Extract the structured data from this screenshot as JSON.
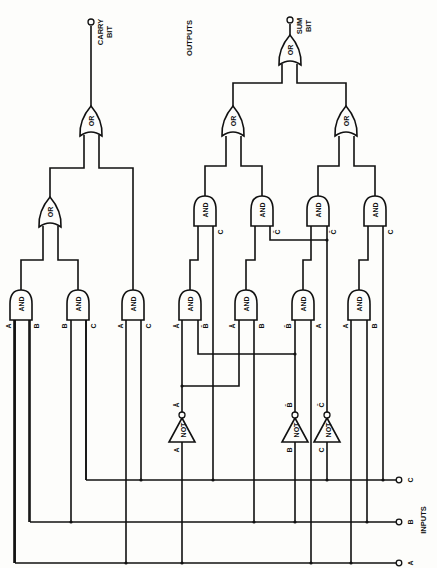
{
  "diagram": {
    "type": "full-adder logic circuit",
    "orientation": "rotated 90deg (inputs at bottom, outputs at top)",
    "labels": {
      "outputs": "OUTPUTS",
      "inputs": "INPUTS",
      "carry_line1": "CARRY",
      "carry_line2": "BIT",
      "sum_line1": "SUM",
      "sum_line2": "BIT"
    },
    "inputs": [
      {
        "id": "A",
        "label": "A"
      },
      {
        "id": "B",
        "label": "B"
      },
      {
        "id": "C",
        "label": "C"
      }
    ],
    "gate_names": {
      "and": "AND",
      "or": "OR",
      "not": "NOT"
    },
    "not_gates": [
      {
        "id": "not-a",
        "in": "A",
        "out": "Ā"
      },
      {
        "id": "not-b",
        "in": "B",
        "out": "B̄"
      },
      {
        "id": "not-c",
        "in": "C",
        "out": "C̄"
      }
    ],
    "carry_section": {
      "and_gates": [
        {
          "id": "and-ab",
          "inputs": [
            "A",
            "B"
          ]
        },
        {
          "id": "and-bc",
          "inputs": [
            "B",
            "C"
          ]
        },
        {
          "id": "and-ac",
          "inputs": [
            "A",
            "C"
          ]
        }
      ],
      "or_gates": [
        {
          "id": "or-carry-1",
          "inputs": [
            "and-ab",
            "and-bc"
          ]
        },
        {
          "id": "or-carry-2",
          "inputs": [
            "or-carry-1",
            "and-ac"
          ]
        }
      ],
      "output": "CARRY BIT"
    },
    "sum_section": {
      "lower_and_gates": [
        {
          "id": "and-nanb",
          "inputs": [
            "Ā",
            "B̄"
          ]
        },
        {
          "id": "and-nab",
          "inputs": [
            "Ā",
            "B"
          ]
        },
        {
          "id": "and-nba",
          "inputs": [
            "B̄",
            "A"
          ]
        },
        {
          "id": "and-ab2",
          "inputs": [
            "A",
            "B"
          ]
        }
      ],
      "upper_and_gates": [
        {
          "id": "and-u1",
          "inputs": [
            "and-nanb",
            "C"
          ]
        },
        {
          "id": "and-u2",
          "inputs": [
            "and-nab",
            "C̄"
          ]
        },
        {
          "id": "and-u3",
          "inputs": [
            "and-nba",
            "C̄"
          ]
        },
        {
          "id": "and-u4",
          "inputs": [
            "and-ab2",
            "C"
          ]
        }
      ],
      "or_gates": [
        {
          "id": "or-sum-left",
          "inputs": [
            "and-u1",
            "and-u2"
          ]
        },
        {
          "id": "or-sum-right",
          "inputs": [
            "and-u3",
            "and-u4"
          ]
        },
        {
          "id": "or-sum-top",
          "inputs": [
            "or-sum-left",
            "or-sum-right"
          ]
        }
      ],
      "output": "SUM BIT"
    },
    "pin_labels": {
      "carry_and_1": [
        "A",
        "B"
      ],
      "carry_and_2": [
        "B",
        "C"
      ],
      "carry_and_3": [
        "A",
        "C"
      ],
      "sum_and_low_1": [
        "Ā",
        "B̄"
      ],
      "sum_and_low_2": [
        "Ā",
        "B"
      ],
      "sum_and_low_3": [
        "B̄",
        "A"
      ],
      "sum_and_low_4": [
        "A",
        "B"
      ],
      "sum_and_up_1": "C",
      "sum_and_up_2": "C̄",
      "sum_and_up_3": "C̄",
      "sum_and_up_4": "C"
    },
    "colors": {
      "ink": "#111111",
      "paper": "#fdfdfb"
    }
  }
}
